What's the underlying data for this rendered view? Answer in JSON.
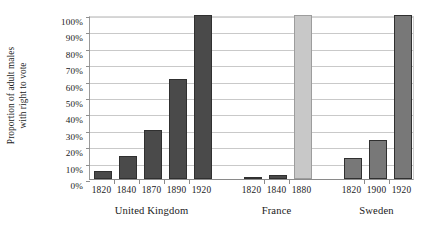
{
  "chart_data": {
    "type": "bar",
    "title": "",
    "xlabel": "",
    "ylabel": "Proportion of adult males with right to vote",
    "ylabel_lines": [
      "Proportion of adult males",
      "with right to vote"
    ],
    "ylim": [
      0,
      100
    ],
    "y_tick_labels": [
      "100%",
      "90%",
      "80%",
      "70%",
      "60%",
      "50%",
      "40%",
      "30%",
      "20%",
      "10%",
      "0%"
    ],
    "y_tick_values": [
      100,
      90,
      80,
      70,
      60,
      50,
      40,
      30,
      20,
      10,
      0
    ],
    "grid": "horizontal",
    "legend": "none",
    "categories": [
      "1820",
      "1840",
      "1870",
      "1890",
      "1920",
      "1820",
      "1840",
      "1880",
      "1820",
      "1900",
      "1920"
    ],
    "values": [
      5,
      14,
      30,
      61,
      100,
      1,
      2.5,
      100,
      13,
      24,
      100
    ],
    "groups": [
      {
        "name": "United Kingdom",
        "color": "#4a4a4a",
        "bars": [
          {
            "label": "1820",
            "value": 5,
            "color": "#4a4a4a"
          },
          {
            "label": "1840",
            "value": 14,
            "color": "#4a4a4a"
          },
          {
            "label": "1870",
            "value": 30,
            "color": "#4a4a4a"
          },
          {
            "label": "1890",
            "value": 61,
            "color": "#4a4a4a"
          },
          {
            "label": "1920",
            "value": 100,
            "color": "#4a4a4a"
          }
        ]
      },
      {
        "name": "France",
        "color": "#4a4a4a",
        "bars": [
          {
            "label": "1820",
            "value": 1,
            "color": "#4a4a4a"
          },
          {
            "label": "1840",
            "value": 2.5,
            "color": "#4a4a4a"
          },
          {
            "label": "1880",
            "value": 100,
            "color": "#c8c8c8"
          }
        ]
      },
      {
        "name": "Sweden",
        "color": "#787878",
        "bars": [
          {
            "label": "1820",
            "value": 13,
            "color": "#787878"
          },
          {
            "label": "1900",
            "value": 24,
            "color": "#787878"
          },
          {
            "label": "1920",
            "value": 100,
            "color": "#787878"
          }
        ]
      }
    ]
  },
  "colors": {
    "uk_bar": "#4a4a4a",
    "france_bar": "#4a4a4a",
    "france_1880_bar": "#c8c8c8",
    "sweden_bar": "#787878",
    "gridline": "#c9c9c9",
    "axis": "#8a8a8a",
    "text": "#1a1a1a",
    "background": "#ffffff"
  }
}
